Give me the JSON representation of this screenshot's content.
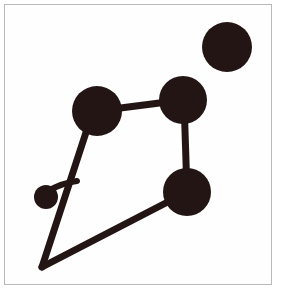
{
  "figure": {
    "title": "Constellation-style node and link diagram",
    "background_color": "#ffffff",
    "frame_color": "#b9b9b9",
    "ink_color": "#231514",
    "canvas": {
      "width": 282,
      "height": 300
    },
    "frame": {
      "x": 4,
      "y": 4,
      "width": 268,
      "height": 281
    },
    "nodes": [
      {
        "id": "node-top-right",
        "label": "top-right-isolated-node",
        "cx": 227,
        "cy": 47,
        "r": 25,
        "size": "large",
        "connected": false
      },
      {
        "id": "node-upper-left",
        "label": "upper-left-node",
        "cx": 97,
        "cy": 111,
        "r": 25,
        "size": "large",
        "connected": true
      },
      {
        "id": "node-upper-right",
        "label": "upper-right-node",
        "cx": 183,
        "cy": 100,
        "r": 24,
        "size": "large",
        "connected": true
      },
      {
        "id": "node-lower-right",
        "label": "lower-right-node",
        "cx": 187,
        "cy": 192,
        "r": 24,
        "size": "large",
        "connected": true
      },
      {
        "id": "node-small-left",
        "label": "small-left-node",
        "cx": 46,
        "cy": 197,
        "r": 12,
        "size": "small",
        "connected": true
      }
    ],
    "vertices": [
      {
        "id": "vertex-bottom-apex",
        "label": "bottom-apex-vertex",
        "x": 42,
        "y": 267
      },
      {
        "id": "vertex-branch-junction",
        "label": "branch-junction",
        "x": 77,
        "y": 181
      }
    ],
    "edges": [
      {
        "id": "edge-upper-left-to-upper-right",
        "label": "upper-left to upper-right",
        "from": "node-upper-left",
        "to": "node-upper-right",
        "x1": 97,
        "y1": 111,
        "x2": 183,
        "y2": 100,
        "width": 7
      },
      {
        "id": "edge-upper-right-to-lower-right",
        "label": "upper-right to lower-right",
        "from": "node-upper-right",
        "to": "node-lower-right",
        "x1": 184,
        "y1": 100,
        "x2": 187,
        "y2": 192,
        "width": 7
      },
      {
        "id": "edge-upper-left-to-apex",
        "label": "upper-left to bottom apex",
        "from": "node-upper-left",
        "to": "vertex-bottom-apex",
        "x1": 93,
        "y1": 111,
        "x2": 42,
        "y2": 267,
        "width": 7
      },
      {
        "id": "edge-lower-right-to-apex",
        "label": "lower-right to bottom apex",
        "from": "node-lower-right",
        "to": "vertex-bottom-apex",
        "x1": 187,
        "y1": 192,
        "x2": 42,
        "y2": 267,
        "width": 7
      },
      {
        "id": "edge-small-node-branch",
        "label": "small node to branch junction",
        "from": "node-small-left",
        "to": "vertex-branch-junction",
        "x1": 48,
        "y1": 191,
        "x2": 77,
        "y2": 181,
        "width": 6,
        "curved": true,
        "control_x": 62,
        "control_y": 183
      }
    ],
    "counts": {
      "nodes_total": 5,
      "large_nodes": 4,
      "small_nodes": 1,
      "edges_total": 5
    }
  }
}
